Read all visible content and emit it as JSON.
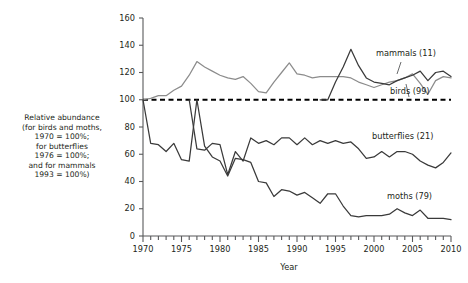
{
  "chart_data": {
    "type": "line",
    "title": "",
    "xlabel": "Year",
    "ylabel": "Relative abundance\n(for birds and moths,\n1970 = 100%;\nfor butterflies\n1976 = 100%;\nand for mammals\n1993 = 100%)",
    "xlim": [
      1970,
      2010
    ],
    "ylim": [
      0,
      160
    ],
    "ytick_labels": [
      "160",
      "140",
      "120",
      "100",
      "80",
      "60",
      "40",
      "20",
      "0"
    ],
    "ytick_values": [
      160,
      140,
      120,
      100,
      80,
      60,
      40,
      20,
      0
    ],
    "xtick_labels": [
      "1970",
      "1975",
      "1980",
      "1985",
      "1990",
      "1995",
      "2000",
      "2005",
      "2010"
    ],
    "xtick_values": [
      1970,
      1975,
      1980,
      1985,
      1990,
      1995,
      2000,
      2005,
      2010
    ],
    "minor_xtick_interval": 1,
    "grid": false,
    "legend_position": "inline-annotations",
    "reference_line": {
      "value": 100,
      "style": "dashed",
      "color": "#000000"
    },
    "colors": {
      "birds": "#8c8c8c",
      "mammals": "#3a3a3a",
      "butterflies": "#3a3a3a",
      "moths": "#3a3a3a"
    },
    "series": [
      {
        "name": "birds (99)",
        "label": "birds (99)",
        "color": "#8c8c8c",
        "x": [
          1970,
          1971,
          1972,
          1973,
          1974,
          1975,
          1976,
          1977,
          1978,
          1979,
          1980,
          1981,
          1982,
          1983,
          1984,
          1985,
          1986,
          1987,
          1988,
          1989,
          1990,
          1991,
          1992,
          1993,
          1994,
          1995,
          1996,
          1997,
          1998,
          1999,
          2000,
          2001,
          2002,
          2003,
          2004,
          2005,
          2006,
          2007,
          2008,
          2009,
          2010
        ],
        "values": [
          100,
          101,
          103,
          103,
          107,
          110,
          118,
          128,
          124,
          121,
          118,
          116,
          115,
          117,
          112,
          106,
          105,
          113,
          120,
          127,
          119,
          118,
          116,
          117,
          117,
          117,
          117,
          116,
          113,
          111,
          109,
          111,
          113,
          114,
          116,
          119,
          112,
          104,
          114,
          117,
          116
        ]
      },
      {
        "name": "mammals (11)",
        "label": "mammals (11)",
        "color": "#3a3a3a",
        "x": [
          1993,
          1994,
          1995,
          1996,
          1997,
          1998,
          1999,
          2000,
          2001,
          2002,
          2003,
          2004,
          2005,
          2006,
          2007,
          2008,
          2009,
          2010
        ],
        "values": [
          100,
          100,
          113,
          124,
          137,
          125,
          116,
          113,
          112,
          111,
          114,
          116,
          118,
          121,
          114,
          120,
          121,
          117
        ]
      },
      {
        "name": "butterflies (21)",
        "label": "butterflies (21)",
        "color": "#3a3a3a",
        "x": [
          1976,
          1977,
          1978,
          1979,
          1980,
          1981,
          1982,
          1983,
          1984,
          1985,
          1986,
          1987,
          1988,
          1989,
          1990,
          1991,
          1992,
          1993,
          1994,
          1995,
          1996,
          1997,
          1998,
          1999,
          2000,
          2001,
          2002,
          2003,
          2004,
          2005,
          2006,
          2007,
          2008,
          2009,
          2010
        ],
        "values": [
          100,
          64,
          63,
          68,
          67,
          45,
          62,
          55,
          72,
          68,
          70,
          67,
          72,
          72,
          67,
          72,
          67,
          70,
          68,
          70,
          68,
          69,
          64,
          57,
          58,
          62,
          58,
          62,
          62,
          60,
          55,
          52,
          50,
          54,
          61
        ]
      },
      {
        "name": "moths (79)",
        "label": "moths (79)",
        "color": "#3a3a3a",
        "x": [
          1970,
          1971,
          1972,
          1973,
          1974,
          1975,
          1976,
          1977,
          1978,
          1979,
          1980,
          1981,
          1982,
          1983,
          1984,
          1985,
          1986,
          1987,
          1988,
          1989,
          1990,
          1991,
          1992,
          1993,
          1994,
          1995,
          1996,
          1997,
          1998,
          1999,
          2000,
          2001,
          2002,
          2003,
          2004,
          2005,
          2006,
          2007,
          2008,
          2009,
          2010
        ],
        "values": [
          100,
          68,
          67,
          62,
          68,
          56,
          55,
          100,
          66,
          58,
          55,
          44,
          57,
          56,
          54,
          40,
          39,
          29,
          34,
          33,
          30,
          32,
          28,
          24,
          31,
          31,
          22,
          15,
          14,
          15,
          15,
          15,
          16,
          20,
          17,
          15,
          19,
          13,
          13,
          13,
          12
        ]
      }
    ],
    "annotations": [
      {
        "text": "mammals (11)",
        "x": 2002,
        "y": 128
      },
      {
        "text": "birds (99)",
        "x": 2003,
        "y": 92
      },
      {
        "text": "butterflies (21)",
        "x": 2002,
        "y": 77
      },
      {
        "text": "moths (79)",
        "x": 2003,
        "y": 28
      }
    ]
  }
}
